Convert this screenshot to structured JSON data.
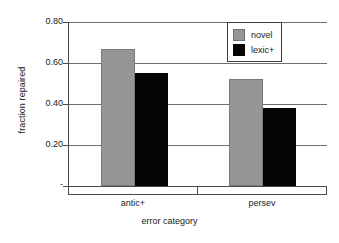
{
  "chart_data": {
    "type": "bar",
    "title": "",
    "xlabel": "error category",
    "ylabel": "fraction repaired",
    "categories": [
      "antic+",
      "persev"
    ],
    "series": [
      {
        "name": "novel",
        "values": [
          0.67,
          0.52
        ],
        "color": "#969696"
      },
      {
        "name": "lexic+",
        "values": [
          0.55,
          0.38
        ],
        "color": "#050505"
      }
    ],
    "ylim": [
      0,
      0.8
    ],
    "yticks": [
      "-",
      "0.20",
      "0.40",
      "0.60",
      "0.80"
    ],
    "ytick_values": [
      0,
      0.2,
      0.4,
      0.6,
      0.8
    ],
    "grid": true,
    "legend_position": "top-right"
  },
  "axes": {
    "y_title": "fraction repaired",
    "x_title": "error category",
    "y_ticks": [
      {
        "label": "0.80",
        "value": 0.8
      },
      {
        "label": "0.60",
        "value": 0.6
      },
      {
        "label": "0.40",
        "value": 0.4
      },
      {
        "label": "0.20",
        "value": 0.2
      },
      {
        "label": "-",
        "value": 0.0
      }
    ],
    "x_ticks": [
      {
        "label": "antic+"
      },
      {
        "label": "persev"
      }
    ]
  },
  "legend": {
    "entries": [
      {
        "label": "novel",
        "color": "#969696"
      },
      {
        "label": "lexic+",
        "color": "#050505"
      }
    ]
  },
  "colors": {
    "novel": "#969696",
    "lexic": "#050505",
    "grid": "#6e6e6e",
    "axis": "#4a4a4a",
    "text": "#1a1a1a",
    "background": "#ffffff"
  }
}
